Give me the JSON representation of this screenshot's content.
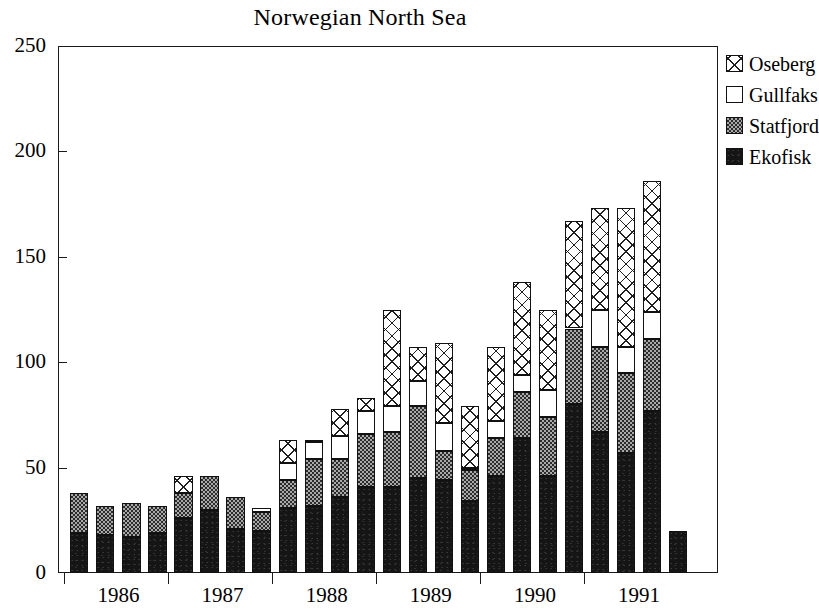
{
  "chart_data": {
    "type": "bar",
    "stacked": true,
    "title": "Norwegian North Sea",
    "xlabel": "",
    "ylabel": "",
    "ylim": [
      0,
      250
    ],
    "ytick_labels": [
      "0",
      "50",
      "100",
      "150",
      "200",
      "250"
    ],
    "ytick_values": [
      0,
      50,
      100,
      150,
      200,
      250
    ],
    "grid": false,
    "legend_position": "right",
    "xtick_labels": [
      "1986",
      "1987",
      "1988",
      "1989",
      "1990",
      "1991"
    ],
    "categories": [
      "1986 Q1",
      "1986 Q2",
      "1986 Q3",
      "1986 Q4",
      "1987 Q1",
      "1987 Q2",
      "1987 Q3",
      "1987 Q4",
      "1988 Q1",
      "1988 Q2",
      "1988 Q3",
      "1988 Q4",
      "1989 Q1",
      "1989 Q2",
      "1989 Q3",
      "1989 Q4",
      "1990 Q1",
      "1990 Q2",
      "1990 Q3",
      "1990 Q4",
      "1991 Q1",
      "1991 Q2",
      "1991 Q3",
      "1991 Q4"
    ],
    "series": [
      {
        "name": "Ekofisk",
        "fill": "solid-black",
        "values": [
          19,
          18,
          17,
          19,
          26,
          30,
          21,
          20,
          31,
          32,
          36,
          41,
          41,
          45,
          44,
          34,
          46,
          64,
          46,
          80,
          67,
          57,
          77,
          20
        ]
      },
      {
        "name": "Statfjord",
        "fill": "dotted-gray",
        "values": [
          19,
          14,
          16,
          13,
          12,
          16,
          15,
          9,
          13,
          22,
          18,
          25,
          26,
          34,
          14,
          15,
          18,
          22,
          28,
          36,
          40,
          38,
          34,
          0
        ]
      },
      {
        "name": "Gullfaks",
        "fill": "white",
        "values": [
          0,
          0,
          0,
          0,
          0,
          0,
          0,
          2,
          8,
          8,
          11,
          11,
          12,
          12,
          13,
          1,
          8,
          8,
          13,
          0,
          18,
          12,
          13,
          0
        ]
      },
      {
        "name": "Oseberg",
        "fill": "crosshatch",
        "values": [
          0,
          0,
          0,
          0,
          8,
          0,
          0,
          0,
          11,
          1,
          13,
          6,
          46,
          16,
          38,
          29,
          35,
          44,
          38,
          51,
          48,
          66,
          62,
          0
        ]
      }
    ],
    "totals": [
      38,
      32,
      33,
      32,
      46,
      46,
      36,
      31,
      63,
      63,
      78,
      83,
      125,
      107,
      109,
      79,
      107,
      138,
      125,
      167,
      173,
      173,
      186,
      191
    ]
  },
  "legend": {
    "items": [
      {
        "label": "Oseberg",
        "swatch": "crosshatch-swatch"
      },
      {
        "label": "Gullfaks",
        "swatch": "white-swatch"
      },
      {
        "label": "Statfjord",
        "swatch": "dotted-swatch"
      },
      {
        "label": "Ekofisk",
        "swatch": "black-swatch"
      }
    ]
  },
  "colors": {
    "axis": "#1a1a1a",
    "ekofisk": "#151515",
    "statfjord": "#a9a9a9",
    "gullfaks": "#ffffff",
    "oseberg": "#ffffff",
    "background": "#ffffff"
  }
}
